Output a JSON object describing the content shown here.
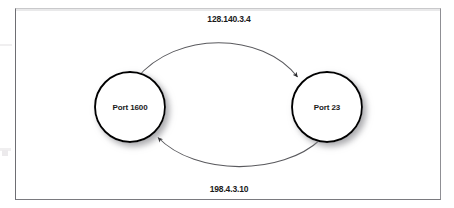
{
  "figure": {
    "type": "network-flow-diagram",
    "background_color": "#ffffff",
    "frame": {
      "border_color": "#6e6e73",
      "x": 15,
      "y": 8,
      "width": 426,
      "height": 192
    }
  },
  "nodes": [
    {
      "id": "node-port-1600",
      "label": "Port 1600",
      "cx": 130,
      "cy": 107,
      "r": 35,
      "fill": "#ffffff",
      "stroke": "#000000"
    },
    {
      "id": "node-port-23",
      "label": "Port 23",
      "cx": 327,
      "cy": 107,
      "r": 35,
      "fill": "#ffffff",
      "stroke": "#000000"
    }
  ],
  "edges": [
    {
      "id": "edge-outbound",
      "label": "128.140.3.4",
      "from": "node-port-1600",
      "to": "node-port-23",
      "direction": "left-to-right",
      "position": "top",
      "label_x": 229,
      "label_y": 20,
      "stroke": "#ululated"
    },
    {
      "id": "edge-inbound",
      "label": "198.4.3.10",
      "from": "node-port-23",
      "to": "node-port-1600",
      "direction": "right-to-left",
      "position": "bottom",
      "label_x": 229,
      "label_y": 190,
      "stroke": "#555558"
    }
  ],
  "colors": {
    "stroke_dark": "#000000",
    "stroke_curve": "#5a5a5e",
    "text": "#1a1a1a",
    "frame": "#6e6e73",
    "shadow": "#b9b9bd"
  }
}
